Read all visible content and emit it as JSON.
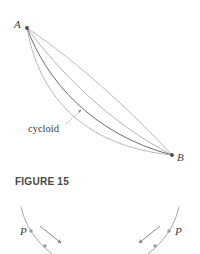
{
  "figure": {
    "caption": "FIGURE 15",
    "caption_position": {
      "x": 15,
      "y": 176
    },
    "background_color": "#ffffff",
    "width": 200,
    "height": 254
  },
  "main_diagram": {
    "name": "brachistochrone-curves",
    "points": [
      {
        "id": "A",
        "label": "A",
        "x": 27,
        "y": 28,
        "label_x": 14,
        "label_y": 19
      },
      {
        "id": "B",
        "label": "B",
        "x": 172,
        "y": 155,
        "label_x": 177,
        "label_y": 152
      }
    ],
    "point_color": "#4a4a4a",
    "point_radius": 1.9,
    "curves": [
      {
        "name": "path-straight-chord",
        "color": "#a8a8a8",
        "width": 0.8,
        "d": "M27,28 C78,62 132,112 172,155"
      },
      {
        "name": "path-shallow-arc",
        "color": "#a2a2a2",
        "width": 0.8,
        "d": "M27,28 C60,72 108,122 172,155"
      },
      {
        "name": "path-cycloid",
        "color": "#6d6d6d",
        "width": 1.0,
        "d": "M27,28 C46,80 92,134 172,155"
      },
      {
        "name": "path-deep-arc",
        "color": "#a6a6a6",
        "width": 0.8,
        "d": "M27,28 C38,92 80,146 172,155"
      }
    ],
    "annotation": {
      "label": "cycloid",
      "label_x": 28,
      "label_y": 124,
      "leader_color": "#6f6f6f",
      "leader": {
        "x1": 66,
        "y1": 124,
        "x2": 81,
        "y2": 110
      }
    }
  },
  "bottom_left_diagram": {
    "name": "particle-descent-left",
    "curve_color": "#9d9d9d",
    "curve": "M21,207 C25,224 34,240 52,254",
    "particle": {
      "label": "P",
      "x": 31,
      "y": 231,
      "label_x": 20,
      "label_y": 226
    },
    "second_marker": {
      "x": 45,
      "y": 246
    },
    "point_color": "#9a9a9a",
    "arrow": {
      "x1": 40,
      "y1": 226,
      "x2": 61,
      "y2": 243,
      "color": "#777777"
    }
  },
  "bottom_right_diagram": {
    "name": "particle-descent-right",
    "curve_color": "#9d9d9d",
    "curve": "M179,207 C175,224 166,240 148,254",
    "particle": {
      "label": "P",
      "x": 169,
      "y": 231,
      "label_x": 175,
      "label_y": 226
    },
    "second_marker": {
      "x": 155,
      "y": 246
    },
    "point_color": "#9a9a9a",
    "arrow": {
      "x1": 160,
      "y1": 226,
      "x2": 139,
      "y2": 243,
      "color": "#777777"
    }
  }
}
